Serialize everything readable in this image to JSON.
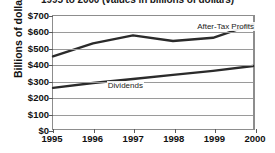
{
  "chart_data": {
    "type": "line",
    "title": "1995 to 2000 (values in billions of dollars)",
    "xlabel": "",
    "ylabel": "Billions of dollars",
    "categories": [
      "1995",
      "1996",
      "1997",
      "1998",
      "1999",
      "2000"
    ],
    "x": [
      1995,
      1996,
      1997,
      1998,
      1999,
      2000
    ],
    "ylim": [
      0,
      700
    ],
    "ytick_labels": [
      "$0",
      "$100",
      "$200",
      "$300",
      "$400",
      "$500",
      "$600",
      "$700"
    ],
    "ytick_values": [
      0,
      100,
      200,
      300,
      400,
      500,
      600,
      700
    ],
    "grid": true,
    "legend_position": "inline-annotation",
    "series": [
      {
        "name": "After-Tax Profits",
        "values": [
          450,
          530,
          580,
          545,
          565,
          650
        ],
        "color": "#2b2b2b"
      },
      {
        "name": "Dividends",
        "values": [
          255,
          285,
          310,
          335,
          360,
          390
        ],
        "color": "#2b2b2b"
      }
    ],
    "annotations": [
      {
        "text": "After-Tax Profits",
        "x": 1998.55,
        "y": 655
      },
      {
        "text": "Dividends",
        "x": 1996.35,
        "y": 300
      }
    ]
  }
}
